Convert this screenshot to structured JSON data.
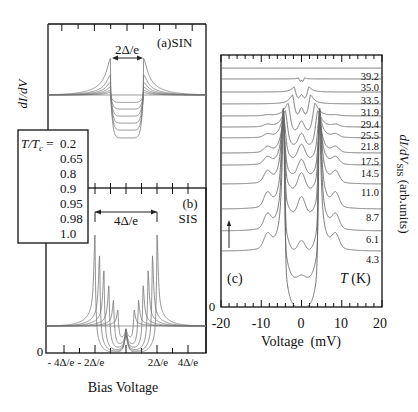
{
  "chart_data": [
    {
      "panel": "a",
      "type": "line",
      "title": "(a)SIN",
      "ylabel": "dI/dV",
      "annotation": "2Δ/e",
      "xunit": "Δ/e",
      "xlim": [
        -4.9,
        4.8
      ],
      "gap": 1.0,
      "baseline": 0,
      "grid": false,
      "legend": {
        "title_main": "T/T",
        "title_sub": "c",
        "title_eq": " =",
        "placement": "left"
      },
      "series": [
        {
          "name": "0.2",
          "peak": 1.0,
          "dip": 1.16
        },
        {
          "name": "0.65",
          "peak": 0.55,
          "dip": 0.95
        },
        {
          "name": "0.8",
          "peak": 0.35,
          "dip": 0.76
        },
        {
          "name": "0.9",
          "peak": 0.22,
          "dip": 0.57
        },
        {
          "name": "0.95",
          "peak": 0.13,
          "dip": 0.38
        },
        {
          "name": "0.98",
          "peak": 0.07,
          "dip": 0.2
        },
        {
          "name": "1.0",
          "peak": 0.0,
          "dip": 0.0
        }
      ]
    },
    {
      "panel": "b",
      "type": "line",
      "title_letter": "(b)",
      "title": "SIS",
      "annotation": "4Δ/e",
      "xlabel": "Bias Voltage",
      "xunit": "Δ/e",
      "xlim": [
        -5.2,
        5.1
      ],
      "xticks": [
        -4,
        -2,
        2,
        4
      ],
      "xticklabels": [
        "- 4Δ/e",
        "- 2Δ/e",
        "2Δ/e",
        "4Δ/e"
      ],
      "ytick_label": "0",
      "baseline": 1.0,
      "grid": false,
      "series": [
        {
          "name": "0.2",
          "gap": 2.0,
          "peak": 3.37,
          "dip": 0.97,
          "cusp": 0.85
        },
        {
          "name": "0.65",
          "gap": 1.7,
          "peak": 2.63,
          "dip": 0.93,
          "cusp": 0.8
        },
        {
          "name": "0.8",
          "gap": 1.42,
          "peak": 2.07,
          "dip": 0.88,
          "cusp": 0.75
        },
        {
          "name": "0.9",
          "gap": 1.1,
          "peak": 1.52,
          "dip": 0.8,
          "cusp": 0.65
        },
        {
          "name": "0.95",
          "gap": 0.8,
          "peak": 0.96,
          "dip": 0.68,
          "cusp": 0.55
        },
        {
          "name": "0.98",
          "gap": 0.52,
          "peak": 0.6,
          "dip": 0.45,
          "cusp": 0.35
        },
        {
          "name": "1.0",
          "gap": 0.0,
          "peak": 0.0,
          "dip": 0.0,
          "cusp": 0.0
        }
      ]
    },
    {
      "panel": "c",
      "type": "line",
      "title": "(c)",
      "xlabel": "Voltage  (mV)",
      "ylabel": "dI/dV",
      "ylabel_sub": "SIS",
      "ylabel_unit": " (arb.units)",
      "xlim": [
        -20,
        20
      ],
      "xticks": [
        -20,
        -10,
        0,
        10,
        20
      ],
      "xticklabels": [
        "-20",
        "-10",
        "0",
        "10",
        "20"
      ],
      "ylim": [
        0,
        100
      ],
      "ytick_label": "0",
      "legend_title_var": "T",
      "legend_title_unit": " (K)",
      "legend_placement": "right",
      "grid": false,
      "series": [
        {
          "name": "39.2",
          "offset": 94.8,
          "gap_mV": 0,
          "peak": 0,
          "dip": 0,
          "center": 0,
          "side": 0,
          "width_mV": 1.0
        },
        {
          "name": "35.0",
          "offset": 90.5,
          "gap_mV": 0.7,
          "peak": 0.4,
          "dip": 1.2,
          "center": 0.7,
          "side": 0,
          "width_mV": 0.5
        },
        {
          "name": "33.5",
          "offset": 85.3,
          "gap_mV": 1.8,
          "peak": 2.0,
          "dip": 2.6,
          "center": 1.6,
          "side": 0,
          "width_mV": 0.8
        },
        {
          "name": "31.9",
          "offset": 80.6,
          "gap_mV": 2.2,
          "peak": 3.5,
          "dip": 4.5,
          "center": 3.0,
          "side": 0,
          "width_mV": 0.9
        },
        {
          "name": "29.4",
          "offset": 75.8,
          "gap_mV": 3.3,
          "peak": 5.0,
          "dip": 6.0,
          "center": 4.0,
          "side": 0.3,
          "width_mV": 1.0
        },
        {
          "name": "25.5",
          "offset": 71.4,
          "gap_mV": 4.0,
          "peak": 6.5,
          "dip": 7.5,
          "center": 5.0,
          "side": 0.8,
          "width_mV": 1.0
        },
        {
          "name": "21.8",
          "offset": 67.1,
          "gap_mV": 4.4,
          "peak": 8.5,
          "dip": 8.5,
          "center": 6.0,
          "side": 1.2,
          "width_mV": 0.9
        },
        {
          "name": "17.5",
          "offset": 61.1,
          "gap_mV": 4.5,
          "peak": 12,
          "dip": 9.0,
          "center": 6.5,
          "side": 2.0,
          "width_mV": 0.8
        },
        {
          "name": "14.5",
          "offset": 56.3,
          "gap_mV": 4.5,
          "peak": 18,
          "dip": 10,
          "center": 7.0,
          "side": 2.5,
          "width_mV": 0.7
        },
        {
          "name": "11.0",
          "offset": 48.8,
          "gap_mV": 4.5,
          "peak": 30,
          "dip": 12,
          "center": 7.0,
          "side": 4.0,
          "width_mV": 0.6
        },
        {
          "name": "8.7",
          "offset": 38.9,
          "gap_mV": 4.5,
          "peak": 40,
          "dip": 17,
          "center": 4.5,
          "side": 5.0,
          "width_mV": 0.55
        },
        {
          "name": "6.1",
          "offset": 30.2,
          "gap_mV": 4.5,
          "peak": 48,
          "dip": 19,
          "center": 1.5,
          "side": 5.0,
          "width_mV": 0.5
        },
        {
          "name": "4.3",
          "offset": 22.2,
          "gap_mV": 4.4,
          "peak": 55,
          "dip": 22.2,
          "center": 0,
          "side": 5.0,
          "width_mV": 0.5
        }
      ]
    }
  ]
}
